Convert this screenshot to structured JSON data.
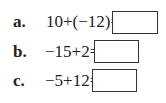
{
  "problems": [
    {
      "label": "a.",
      "expression": "10+(−12)=",
      "answer": ""
    },
    {
      "label": "b.",
      "expression": "−15+2=",
      "answer": ""
    },
    {
      "label": "c.",
      "expression": "−5+12=",
      "answer": ""
    }
  ]
}
